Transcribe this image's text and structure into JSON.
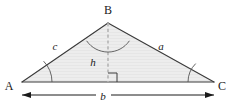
{
  "figure": {
    "background_color": "#ffffff",
    "stroke_color": "#3a3a3a",
    "fill_color": "#ebebeb",
    "dash_color": "#b4b4b4",
    "arc_color": "#555555"
  },
  "vertices": [
    {
      "id": "A",
      "label": "A",
      "x": 22,
      "y": 82,
      "label_x": 9,
      "label_y": 86
    },
    {
      "id": "B",
      "label": "B",
      "x": 108,
      "y": 23,
      "label_x": 104,
      "label_y": 12
    },
    {
      "id": "C",
      "label": "C",
      "x": 214,
      "y": 82,
      "label_x": 220,
      "label_y": 86
    }
  ],
  "sides": [
    {
      "id": "c",
      "label": "c",
      "from": "A",
      "to": "B",
      "label_x": 55,
      "label_y": 47
    },
    {
      "id": "a",
      "label": "a",
      "from": "B",
      "to": "C",
      "label_x": 159,
      "label_y": 47
    },
    {
      "id": "b",
      "label": "b",
      "from": "A",
      "to": "C",
      "label_x": 103,
      "label_y": 99
    }
  ],
  "altitude": {
    "id": "h",
    "label": "h",
    "from_x": 108,
    "from_y": 23,
    "to_x": 108,
    "to_y": 82,
    "label_x": 92,
    "label_y": 62,
    "style": "dashed",
    "right_angle_marker": true
  },
  "angle_arcs": [
    {
      "at": "A",
      "radius": 30
    },
    {
      "at": "B",
      "radius": 26
    },
    {
      "at": "C",
      "radius": 26
    }
  ],
  "dimension_arrow": {
    "id": "b-dimension",
    "label": "b",
    "x1": 22,
    "x2": 214,
    "y": 95,
    "double_headed": true
  }
}
